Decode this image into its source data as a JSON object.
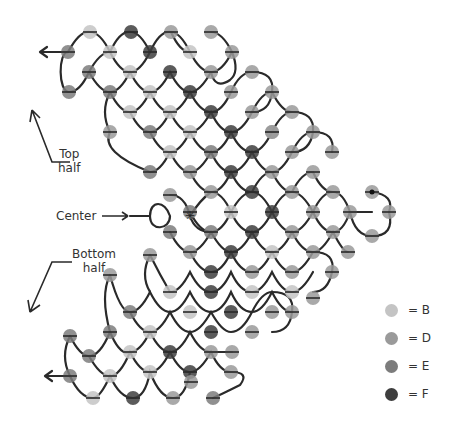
{
  "labels": {
    "top": [
      "Top",
      "half"
    ],
    "center": "Center",
    "bottom": [
      "Bottom",
      "half"
    ]
  },
  "colors": {
    "B": "#c4c4c4",
    "D": "#9a9a9a",
    "E": "#7c7c7c",
    "F": "#3e3e3e",
    "thread": "#2a2a2a"
  },
  "legend": [
    {
      "key": "B",
      "label": "= B"
    },
    {
      "key": "D",
      "label": "= D"
    },
    {
      "key": "E",
      "label": "= E"
    },
    {
      "key": "F",
      "label": "= F"
    }
  ],
  "beads": [
    [
      90,
      32,
      "B"
    ],
    [
      131,
      32,
      "F"
    ],
    [
      171,
      32,
      "D"
    ],
    [
      211,
      32,
      "D"
    ],
    [
      68,
      52,
      "E"
    ],
    [
      110,
      52,
      "B"
    ],
    [
      150,
      52,
      "F"
    ],
    [
      190,
      52,
      "B"
    ],
    [
      232,
      52,
      "D"
    ],
    [
      89,
      72,
      "E"
    ],
    [
      130,
      72,
      "B"
    ],
    [
      170,
      72,
      "F"
    ],
    [
      211,
      72,
      "D"
    ],
    [
      252,
      72,
      "D"
    ],
    [
      69,
      92,
      "E"
    ],
    [
      110,
      92,
      "E"
    ],
    [
      150,
      92,
      "B"
    ],
    [
      190,
      92,
      "F"
    ],
    [
      231,
      92,
      "D"
    ],
    [
      272,
      92,
      "D"
    ],
    [
      130,
      112,
      "B"
    ],
    [
      170,
      112,
      "B"
    ],
    [
      211,
      112,
      "F"
    ],
    [
      252,
      112,
      "D"
    ],
    [
      292,
      112,
      "D"
    ],
    [
      110,
      132,
      "D"
    ],
    [
      150,
      132,
      "E"
    ],
    [
      190,
      132,
      "B"
    ],
    [
      231,
      132,
      "F"
    ],
    [
      272,
      132,
      "D"
    ],
    [
      313,
      132,
      "D"
    ],
    [
      272,
      132,
      "D"
    ],
    [
      170,
      152,
      "B"
    ],
    [
      211,
      152,
      "E"
    ],
    [
      252,
      152,
      "F"
    ],
    [
      292,
      152,
      "D"
    ],
    [
      332,
      152,
      "D"
    ],
    [
      150,
      172,
      "E"
    ],
    [
      190,
      172,
      "D"
    ],
    [
      231,
      172,
      "F"
    ],
    [
      272,
      172,
      "D"
    ],
    [
      313,
      172,
      "D"
    ],
    [
      170,
      195,
      "D"
    ],
    [
      211,
      192,
      "D"
    ],
    [
      252,
      192,
      "F"
    ],
    [
      292,
      192,
      "D"
    ],
    [
      333,
      192,
      "D"
    ],
    [
      372,
      192,
      "D"
    ],
    [
      190,
      212,
      "E"
    ],
    [
      231,
      212,
      "B"
    ],
    [
      272,
      212,
      "F"
    ],
    [
      313,
      212,
      "D"
    ],
    [
      350,
      212,
      "D"
    ],
    [
      389,
      212,
      "D"
    ],
    [
      170,
      232,
      "E"
    ],
    [
      211,
      232,
      "E"
    ],
    [
      252,
      232,
      "F"
    ],
    [
      292,
      232,
      "D"
    ],
    [
      333,
      232,
      "D"
    ],
    [
      372,
      236,
      "D"
    ],
    [
      190,
      252,
      "D"
    ],
    [
      231,
      252,
      "F"
    ],
    [
      272,
      252,
      "B"
    ],
    [
      313,
      252,
      "D"
    ],
    [
      348,
      252,
      "D"
    ],
    [
      150,
      255,
      "D"
    ],
    [
      211,
      272,
      "F"
    ],
    [
      252,
      272,
      "D"
    ],
    [
      292,
      272,
      "D"
    ],
    [
      332,
      272,
      "D"
    ],
    [
      110,
      275,
      "D"
    ],
    [
      170,
      292,
      "B"
    ],
    [
      211,
      292,
      "F"
    ],
    [
      252,
      292,
      "B"
    ],
    [
      292,
      292,
      "B"
    ],
    [
      313,
      298,
      "D"
    ],
    [
      130,
      312,
      "E"
    ],
    [
      190,
      312,
      "B"
    ],
    [
      231,
      312,
      "F"
    ],
    [
      272,
      312,
      "D"
    ],
    [
      292,
      312,
      "D"
    ],
    [
      110,
      332,
      "E"
    ],
    [
      150,
      332,
      "B"
    ],
    [
      211,
      332,
      "F"
    ],
    [
      252,
      332,
      "D"
    ],
    [
      70,
      336,
      "E"
    ],
    [
      130,
      352,
      "B"
    ],
    [
      170,
      352,
      "F"
    ],
    [
      211,
      352,
      "D"
    ],
    [
      232,
      352,
      "D"
    ],
    [
      89,
      356,
      "E"
    ],
    [
      150,
      372,
      "B"
    ],
    [
      190,
      372,
      "F"
    ],
    [
      231,
      372,
      "D"
    ],
    [
      70,
      376,
      "E"
    ],
    [
      110,
      376,
      "B"
    ],
    [
      191,
      382,
      "D"
    ],
    [
      93,
      398,
      "B"
    ],
    [
      133,
      398,
      "F"
    ],
    [
      173,
      398,
      "D"
    ],
    [
      213,
      398,
      "E"
    ]
  ],
  "center_bead": [
    190,
    216
  ],
  "start_bead": [
    372,
    192
  ]
}
